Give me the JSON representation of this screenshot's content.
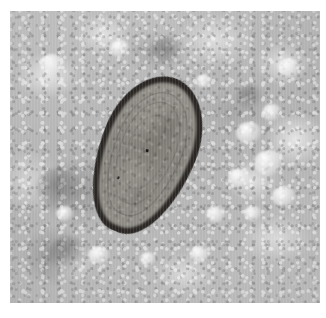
{
  "figure": {
    "kind": "photomicrograph",
    "modality": "brightfield light microscopy",
    "caption": "",
    "canvas": {
      "width_px": 326,
      "height_px": 318,
      "background_color": "#ffffff"
    },
    "field": {
      "name": "microscopy-field",
      "left_px": 10,
      "top_px": 11,
      "width_px": 310,
      "height_px": 292,
      "background_color": "#b6b6b6",
      "description": "mottled grey granular debris field with scattered bright globules"
    }
  },
  "specimen": {
    "label": "parasite egg (helminth ovum)",
    "shape": "ovoid / teardrop",
    "orientation_deg": 22,
    "bounding_box_px": {
      "left": 88,
      "top": 62,
      "width": 96,
      "height": 164
    },
    "colors": {
      "outer_shell": "#2a2724",
      "inner_shell": "#8d8a84",
      "internal_mass": "#8a8781"
    },
    "features": [
      "thick dark refractile outer shell wall",
      "thin lighter inner shell layer",
      "granular internal contents",
      "concentric membrane arcs",
      "small dark specks within the ovum"
    ]
  },
  "background": {
    "tone": "light grey",
    "texture": "granular amorphous debris",
    "artifacts": [
      "bright rounded globules clustered on the right",
      "darker debris aggregate at lower left",
      "faint vertical scan-line striping"
    ],
    "globules": [
      {
        "left_px": 236,
        "top_px": 122,
        "size_px": 26
      },
      {
        "left_px": 262,
        "top_px": 104,
        "size_px": 20
      },
      {
        "left_px": 254,
        "top_px": 150,
        "size_px": 30
      },
      {
        "left_px": 228,
        "top_px": 168,
        "size_px": 22
      },
      {
        "left_px": 272,
        "top_px": 186,
        "size_px": 24
      },
      {
        "left_px": 244,
        "top_px": 206,
        "size_px": 18
      },
      {
        "left_px": 206,
        "top_px": 206,
        "size_px": 20
      },
      {
        "left_px": 278,
        "top_px": 58,
        "size_px": 22
      },
      {
        "left_px": 196,
        "top_px": 74,
        "size_px": 16
      },
      {
        "left_px": 56,
        "top_px": 206,
        "size_px": 18
      },
      {
        "left_px": 88,
        "top_px": 246,
        "size_px": 22
      },
      {
        "left_px": 140,
        "top_px": 252,
        "size_px": 16
      },
      {
        "left_px": 190,
        "top_px": 246,
        "size_px": 20
      },
      {
        "left_px": 40,
        "top_px": 54,
        "size_px": 24
      },
      {
        "left_px": 110,
        "top_px": 40,
        "size_px": 20
      }
    ],
    "dark_blobs": [
      {
        "left_px": 36,
        "top_px": 168,
        "size_px": 46
      },
      {
        "left_px": 48,
        "top_px": 236,
        "size_px": 40
      },
      {
        "left_px": 150,
        "top_px": 36,
        "size_px": 34
      },
      {
        "left_px": 236,
        "top_px": 84,
        "size_px": 28
      }
    ]
  },
  "specks": [
    {
      "left_px": 46,
      "top_px": 76,
      "w_px": 3,
      "h_px": 3
    },
    {
      "left_px": 30,
      "top_px": 112,
      "w_px": 2,
      "h_px": 3
    }
  ]
}
